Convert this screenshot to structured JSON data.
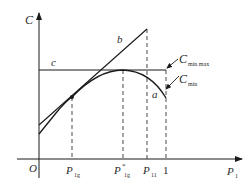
{
  "diagram": {
    "axes": {
      "y_label": "C",
      "x_label": "P",
      "x_label_sub": "1",
      "origin": "O"
    },
    "x_ticks": [
      {
        "main": "P",
        "sub": "1g",
        "sup": ""
      },
      {
        "main": "P",
        "sub": "1g",
        "sup": "*"
      },
      {
        "main": "P",
        "sub": "11",
        "sup": ""
      },
      {
        "main": "1",
        "sub": "",
        "sup": ""
      }
    ],
    "curves": {
      "line_b": "b",
      "line_c": "c",
      "curve_a": "a"
    },
    "annotations": {
      "cmin_max_main": "C",
      "cmin_max_sub": "min max",
      "cmin_main": "C",
      "cmin_sub": "min"
    },
    "colors": {
      "stroke": "#1a1a1a",
      "text": "#2a2a2a",
      "background": "#ffffff"
    }
  }
}
